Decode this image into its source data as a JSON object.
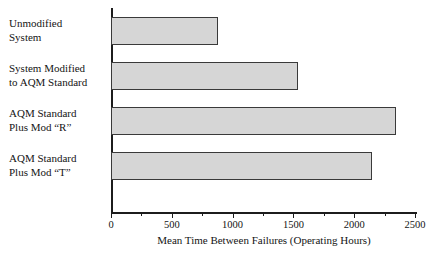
{
  "chart_data": {
    "type": "bar",
    "orientation": "horizontal",
    "title": "",
    "xlabel": "Mean Time Between Failures (Operating Hours)",
    "ylabel": "",
    "xlim": [
      0,
      2500
    ],
    "grid": false,
    "legend": null,
    "xticks": [
      0,
      500,
      1000,
      1500,
      2000,
      2500
    ],
    "xtick_labels": [
      "0",
      "500",
      "1000",
      "1500",
      "2000",
      "2500"
    ],
    "minor_xticks": [
      250,
      750,
      1250,
      1750,
      2250
    ],
    "categories": [
      "Unmodified\nSystem",
      "System Modified\nto AQM Standard",
      "AQM Standard\nPlus Mod “R”",
      "AQM Standard\nPlus Mod “T”"
    ],
    "values": [
      880,
      1540,
      2340,
      2150
    ],
    "bar_fill_color": "#d6d6d6",
    "bar_edge_color": "#3a3a3a",
    "axis_color": "#1c1c1c"
  }
}
